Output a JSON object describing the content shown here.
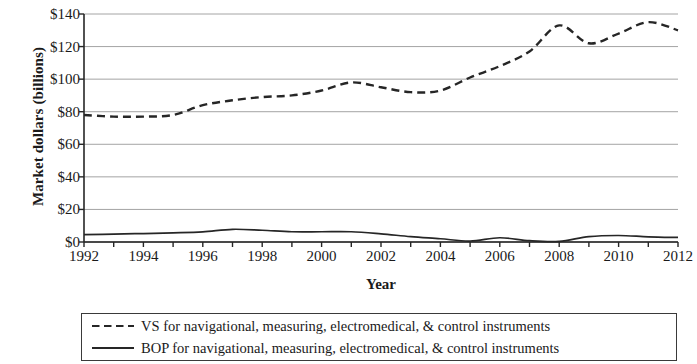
{
  "chart_data": {
    "type": "line",
    "title": "",
    "xlabel": "Year",
    "ylabel": "Market dollars (billions)",
    "xlim": [
      1992,
      2012
    ],
    "ylim": [
      0,
      140
    ],
    "grid": true,
    "legend_position": "below",
    "y_ticks": [
      0,
      20,
      40,
      60,
      80,
      100,
      120,
      140
    ],
    "y_tick_labels": [
      "$0",
      "$20",
      "$40",
      "$60",
      "$80",
      "$100",
      "$120",
      "$140"
    ],
    "x_ticks": [
      1992,
      1994,
      1996,
      1998,
      2000,
      2002,
      2004,
      2006,
      2008,
      2010,
      2012
    ],
    "x_tick_labels": [
      "1992",
      "1994",
      "1996",
      "1998",
      "2000",
      "2002",
      "2004",
      "2006",
      "2008",
      "2010",
      "2012"
    ],
    "x_minor_ticks": [
      1992,
      1993,
      1994,
      1995,
      1996,
      1997,
      1998,
      1999,
      2000,
      2001,
      2002,
      2003,
      2004,
      2005,
      2006,
      2007,
      2008,
      2009,
      2010,
      2011,
      2012
    ],
    "x": [
      1992,
      1993,
      1994,
      1995,
      1996,
      1997,
      1998,
      1999,
      2000,
      2001,
      2002,
      2003,
      2004,
      2005,
      2006,
      2007,
      2008,
      2009,
      2010,
      2011,
      2012
    ],
    "series": [
      {
        "name": "VS for navigational, measuring, electromedical, & control instruments",
        "style": "dashed",
        "color": "#262626",
        "values": [
          78,
          77,
          77,
          78,
          84,
          87,
          89,
          90,
          93,
          98,
          95,
          92,
          93,
          101,
          108,
          117,
          133,
          122,
          128,
          135,
          130
        ]
      },
      {
        "name": "BOP for navigational, measuring, electromedical, & control instruments",
        "style": "solid",
        "color": "#262626",
        "values": [
          4.5,
          4.8,
          5.2,
          5.6,
          6.2,
          7.8,
          7.2,
          6.3,
          6.3,
          6.3,
          5.0,
          3.3,
          2.0,
          0.6,
          2.6,
          0.8,
          0.4,
          3.3,
          4.0,
          3.2,
          2.8
        ]
      }
    ]
  },
  "legend": {
    "entries": [
      {
        "style": "dashed",
        "label": "VS for navigational, measuring, electromedical, & control instruments"
      },
      {
        "style": "solid",
        "label": "BOP for navigational, measuring, electromedical, & control instruments"
      }
    ]
  },
  "axes": {
    "y_title": "Market dollars (billions)",
    "x_title": "Year"
  },
  "colors": {
    "axis": "#262626",
    "gridline": "#9a9a9a",
    "series": "#262626",
    "background": "#ffffff"
  }
}
